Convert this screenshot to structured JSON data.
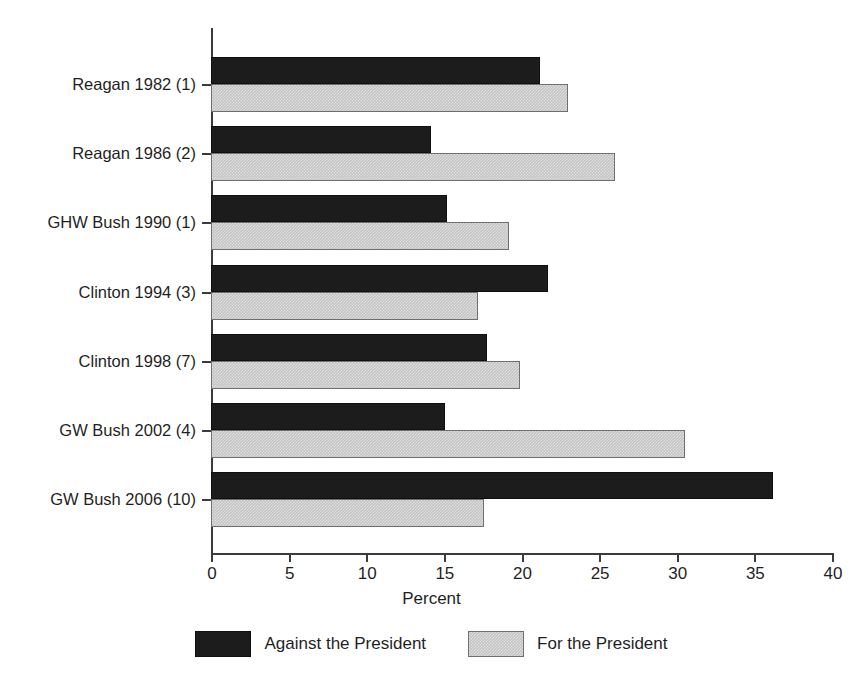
{
  "chart_data": {
    "type": "bar",
    "orientation": "horizontal",
    "title": "",
    "xlabel": "Percent",
    "ylabel": "",
    "xlim": [
      0,
      40
    ],
    "xticks": [
      0,
      5,
      10,
      15,
      20,
      25,
      30,
      35,
      40
    ],
    "grid": false,
    "legend_position": "bottom",
    "categories": [
      "Reagan 1982 (1)",
      "Reagan 1986 (2)",
      "GHW Bush 1990 (1)",
      "Clinton 1994 (3)",
      "Clinton 1998 (7)",
      "GW Bush 2002 (4)",
      "GW Bush 2006 (10)"
    ],
    "series": [
      {
        "name": "Against the President",
        "color": "#1c1c1c",
        "values": [
          21.2,
          14.2,
          15.2,
          21.7,
          17.8,
          15.1,
          36.2
        ]
      },
      {
        "name": "For the President",
        "color": "#c3c3c3",
        "values": [
          23.0,
          26.0,
          19.2,
          17.2,
          19.9,
          30.5,
          17.6
        ]
      }
    ]
  },
  "legend": {
    "items": [
      {
        "label": "Against the President",
        "swatch": "dark-swatch"
      },
      {
        "label": "For the President",
        "swatch": "light-swatch"
      }
    ]
  }
}
